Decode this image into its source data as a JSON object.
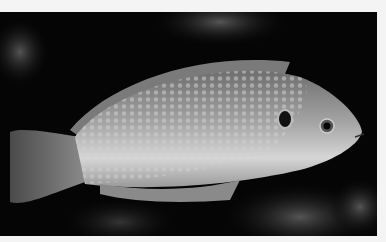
{
  "image": {
    "description": "Grayscale photograph of a wrasse fish swimming left-to-right over dark reef rocks",
    "subject": "fish",
    "colors": {
      "border": "#f4f4f4",
      "background": "#050505",
      "fish_body": "#9a9a9a",
      "belly": "#d8d8d8"
    }
  }
}
